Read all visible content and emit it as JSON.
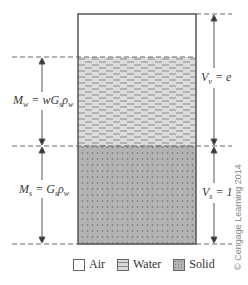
{
  "diagram": {
    "phases": [
      {
        "name": "Air",
        "fill": "#ffffff"
      },
      {
        "name": "Water",
        "fill": "#d9d9d9",
        "pattern": "dashes"
      },
      {
        "name": "Solid",
        "fill": "#b5b5b5",
        "pattern": "dots"
      }
    ],
    "left_labels": {
      "water_mass": "M_w = wG_sρ_w",
      "solid_mass": "M_s = G_sρ_w"
    },
    "right_labels": {
      "void_volume": "V_v = e",
      "solid_volume": "V_s = 1"
    },
    "legend": [
      {
        "label": "Air"
      },
      {
        "label": "Water"
      },
      {
        "label": "Solid"
      }
    ],
    "copyright": "© Cengage Learning 2014"
  }
}
